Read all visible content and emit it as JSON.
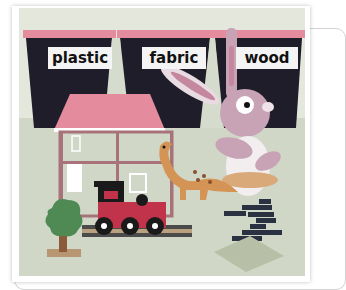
{
  "scene": {
    "description": "Toy sorting illustration with three bins",
    "bins": [
      {
        "label": "plastic"
      },
      {
        "label": "fabric"
      },
      {
        "label": "wood"
      }
    ],
    "toys": [
      "dollhouse",
      "rabbit",
      "dinosaur",
      "train",
      "tree",
      "bricks",
      "baseplate"
    ]
  },
  "colors": {
    "background": "#e3e7dc",
    "floor": "#cfd6c4",
    "bin_top": "#e48c9e",
    "bin": "#1e1d29",
    "label_bg": "#f4f4f4"
  }
}
